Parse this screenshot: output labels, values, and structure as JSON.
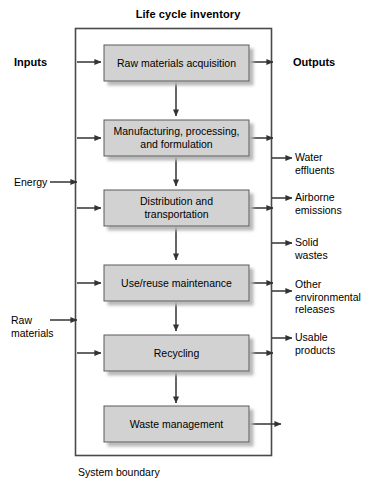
{
  "diagram": {
    "title": "Life cycle inventory",
    "boundary_caption": "System boundary",
    "inputs_header": "Inputs",
    "outputs_header": "Outputs",
    "colors": {
      "box_fill": "#d2d2d2",
      "box_stroke": "#5a5a5a",
      "shadow": "#bdbdbd",
      "boundary_stroke": "#4a4a4a",
      "arrow": "#333333",
      "text": "#000000",
      "background": "#ffffff"
    },
    "process_boxes": [
      {
        "label": "Raw materials acquisition"
      },
      {
        "label": "Manufacturing, processing,\nand formulation"
      },
      {
        "label": "Distribution and\ntransportation"
      },
      {
        "label": "Use/reuse maintenance"
      },
      {
        "label": "Recycling"
      },
      {
        "label": "Waste management"
      }
    ],
    "input_labels": [
      {
        "label": "Energy"
      },
      {
        "label": "Raw\nmaterials"
      }
    ],
    "output_labels": [
      {
        "label": "Water\neffluents"
      },
      {
        "label": "Airborne\nemissions"
      },
      {
        "label": "Solid\nwastes"
      },
      {
        "label": "Other\nenvironmental\nreleases"
      },
      {
        "label": "Usable\nproducts"
      }
    ]
  }
}
